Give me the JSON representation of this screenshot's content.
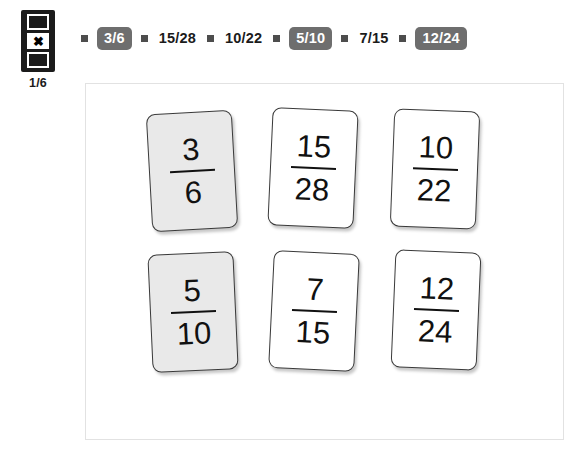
{
  "status": {
    "icon_name": "progress-marker-icon",
    "counter": "1/6",
    "cells": [
      {
        "state": "empty",
        "glyph": ""
      },
      {
        "state": "marked",
        "glyph": "✖"
      },
      {
        "state": "empty",
        "glyph": ""
      }
    ]
  },
  "chip_nav": {
    "separator_name": "chip-separator",
    "items": [
      {
        "label": "3/6",
        "selected": true
      },
      {
        "label": "15/28",
        "selected": false
      },
      {
        "label": "10/22",
        "selected": false
      },
      {
        "label": "5/10",
        "selected": true
      },
      {
        "label": "7/15",
        "selected": false
      },
      {
        "label": "12/24",
        "selected": true
      }
    ]
  },
  "panel": {
    "cards": [
      {
        "numerator": "3",
        "denominator": "6",
        "selected": true
      },
      {
        "numerator": "15",
        "denominator": "28",
        "selected": false
      },
      {
        "numerator": "10",
        "denominator": "22",
        "selected": false
      },
      {
        "numerator": "5",
        "denominator": "10",
        "selected": true
      },
      {
        "numerator": "7",
        "denominator": "15",
        "selected": false
      },
      {
        "numerator": "12",
        "denominator": "24",
        "selected": false
      }
    ]
  },
  "colors": {
    "chip_selected_bg": "#6e6e6e",
    "chip_text": "#1b1b1b",
    "card_shaded_bg": "#e9e9e9",
    "card_border": "#3a3a3a",
    "panel_border": "#e2e2e2",
    "icon_bg": "#1b1b1b"
  }
}
